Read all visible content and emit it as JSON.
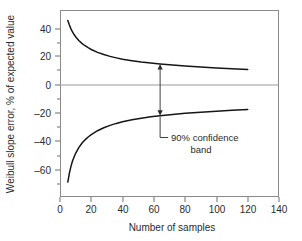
{
  "chart_data": {
    "type": "line",
    "title": "",
    "xlabel": "Number of samples",
    "ylabel": "Weibull slope error, % of expected value",
    "xlim": [
      0,
      140
    ],
    "ylim": [
      -73,
      52
    ],
    "xticks": [
      0,
      20,
      40,
      60,
      80,
      100,
      120,
      140
    ],
    "yticks": [
      40,
      20,
      0,
      -20,
      -40,
      -60
    ],
    "xticklabels": [
      "0",
      "20",
      "40",
      "60",
      "80",
      "100",
      "120",
      "140"
    ],
    "yticklabels": [
      "40",
      "20",
      "0",
      "–20",
      "–40",
      "–60"
    ],
    "grid": false,
    "legend": null,
    "zero_reference_line": 0,
    "series": [
      {
        "name": "upper 90% confidence limit",
        "x": [
          5,
          6,
          7,
          8,
          9,
          10,
          12,
          14,
          16,
          18,
          20,
          24,
          28,
          32,
          36,
          40,
          46,
          52,
          58,
          64,
          72,
          80,
          90,
          100,
          110,
          120
        ],
        "values": [
          45.0,
          42.0,
          39.4,
          37.3,
          35.6,
          34.1,
          31.6,
          29.7,
          28.1,
          26.8,
          25.6,
          23.7,
          22.2,
          21.0,
          20.0,
          19.1,
          18.1,
          17.2,
          16.5,
          15.9,
          15.2,
          14.6,
          13.9,
          13.3,
          12.8,
          12.3
        ]
      },
      {
        "name": "lower 90% confidence limit",
        "x": [
          5,
          6,
          7,
          8,
          9,
          10,
          12,
          14,
          16,
          18,
          20,
          24,
          28,
          32,
          36,
          40,
          46,
          52,
          58,
          64,
          72,
          80,
          90,
          100,
          110,
          120
        ],
        "values": [
          -63.0,
          -57.0,
          -52.5,
          -49.0,
          -46.2,
          -43.8,
          -40.0,
          -37.1,
          -34.8,
          -32.9,
          -31.3,
          -28.7,
          -26.7,
          -25.1,
          -23.8,
          -22.7,
          -21.4,
          -20.3,
          -19.4,
          -18.7,
          -17.8,
          -17.1,
          -16.3,
          -15.6,
          -15.0,
          -14.5
        ]
      }
    ],
    "annotations": [
      {
        "name": "confidence-band-callout",
        "text_line1": "90% confidence",
        "text_line2": "band",
        "arrow_at_x": 64,
        "arrow_top_y": 15.9,
        "arrow_bottom_y": -18.7,
        "style": "double-headed-arrow-with-leader"
      }
    ]
  },
  "axes": {
    "x_title": "Number of samples",
    "y_title": "Weibull slope error, % of expected value"
  },
  "colors": {
    "curve": "#161616",
    "frame": "#8a8a8a",
    "zero_line": "#9a9a9a",
    "text": "#2b2b2b",
    "background": "#ffffff"
  }
}
